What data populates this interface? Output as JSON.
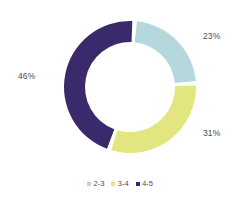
{
  "chart_data": {
    "type": "pie",
    "variant": "donut",
    "title": "",
    "subtitle": "",
    "xlabel": "",
    "ylabel": "",
    "grid": false,
    "legend_position": "bottom",
    "background_color": "#ffffff",
    "label_color": "#4d4d4d",
    "geometry": {
      "center_x": 130,
      "center_y": 87,
      "outer_radius": 66,
      "inner_radius": 45,
      "gap_degrees": 4,
      "start_angle_degrees": -86
    },
    "categories": [
      "2-3",
      "3-4",
      "4-5"
    ],
    "values": [
      23,
      31,
      46
    ],
    "value_labels": [
      "23%",
      "31%",
      "46%"
    ],
    "colors": [
      "#b5d8dd",
      "#e3e581",
      "#3b2a6b"
    ],
    "slices": [
      {
        "label": "2-3",
        "value": 23,
        "value_label": "23%",
        "color": "#b5d8dd",
        "label_x": 203,
        "label_y": 31
      },
      {
        "label": "3-4",
        "value": 31,
        "value_label": "31%",
        "color": "#e3e581",
        "label_x": 203,
        "label_y": 128
      },
      {
        "label": "4-5",
        "value": 46,
        "value_label": "46%",
        "color": "#3b2a6b",
        "label_x": 18,
        "label_y": 71
      }
    ],
    "legend": [
      {
        "label": "2-3",
        "color": "#b5d8dd"
      },
      {
        "label": "3-4",
        "color": "#e3e581"
      },
      {
        "label": "4-5",
        "color": "#3b2a6b"
      }
    ]
  }
}
